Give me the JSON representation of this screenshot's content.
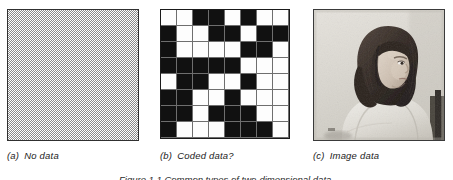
{
  "figure": {
    "background_color": "#ffffff",
    "caption_bottom": "Figure 1.1  Common types of two-dimensional data.",
    "panel_count": 3
  },
  "panels": [
    {
      "id": "panel-a",
      "label": "(a)",
      "caption": "No data",
      "kind": "dither",
      "description": "Uniform 50% checkerboard dither fill",
      "fill_color": "#8a8a8a",
      "border_color": "#303030"
    },
    {
      "id": "panel-b",
      "label": "(b)",
      "caption": "Coded data?",
      "kind": "grid",
      "description": "8 by 8 grid of black and white coded cells",
      "rows": 8,
      "cols": 8,
      "on_color": "#111111",
      "off_color": "#fdfdfd",
      "gridline_color": "#6e6e6e",
      "border_color": "#1a1a1a"
    },
    {
      "id": "panel-c",
      "label": "(c)",
      "caption": "Image data",
      "kind": "photo",
      "description": "Grayscale photographic portrait of a woman with long dark hair wearing a light sweater, seated against a pale wall",
      "border_color": "#3a3a3a",
      "background_color": "#d9d6d0"
    }
  ],
  "chart_data": {
    "type": "heatmap",
    "title": "Coded data?",
    "xlabel": "",
    "ylabel": "",
    "rows": 8,
    "cols": 8,
    "legend": [
      "0 = white cell",
      "1 = black cell"
    ],
    "grid": true,
    "values": [
      [
        0,
        0,
        1,
        1,
        0,
        1,
        0,
        0
      ],
      [
        1,
        0,
        0,
        1,
        1,
        0,
        1,
        1
      ],
      [
        1,
        0,
        0,
        0,
        0,
        1,
        1,
        0
      ],
      [
        1,
        1,
        1,
        1,
        1,
        0,
        0,
        0
      ],
      [
        0,
        1,
        1,
        0,
        0,
        1,
        0,
        0
      ],
      [
        1,
        1,
        0,
        0,
        1,
        0,
        0,
        0
      ],
      [
        1,
        1,
        0,
        1,
        1,
        1,
        0,
        0
      ],
      [
        1,
        0,
        0,
        0,
        1,
        1,
        1,
        0
      ]
    ]
  }
}
